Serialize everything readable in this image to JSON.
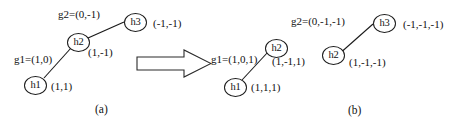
{
  "figure": {
    "type": "diagram",
    "arrow_icon": "right-arrow-icon",
    "line_color": "#1a1a1a",
    "background_color": "#ffffff"
  },
  "panel_a": {
    "caption": "(a)",
    "nodes": [
      {
        "id": "h1",
        "label": "h1",
        "value": "(1,1)"
      },
      {
        "id": "h2",
        "label": "h2",
        "value": "(1,-1)"
      },
      {
        "id": "h3",
        "label": "h3",
        "value": "(-1,-1)"
      }
    ],
    "edges": [
      {
        "id": "g1",
        "label": "g1=(1,0)",
        "from": "h1",
        "to": "h2"
      },
      {
        "id": "g2",
        "label": "g2=(0,-1)",
        "from": "h2",
        "to": "h3"
      }
    ]
  },
  "panel_b": {
    "caption": "(b)",
    "nodes": [
      {
        "id": "h1",
        "label": "h1",
        "value": "(1,1,1)"
      },
      {
        "id": "h2a",
        "label": "h2",
        "value": "(1,-1,1)"
      },
      {
        "id": "h2b",
        "label": "h2",
        "value": "(1,-1,-1)"
      },
      {
        "id": "h3",
        "label": "h3",
        "value": "(-1,-1,-1)"
      }
    ],
    "edges": [
      {
        "id": "g1",
        "label": "g1=(1,0,1)",
        "from": "h1",
        "to": "h2a"
      },
      {
        "id": "g2",
        "label": "g2=(0,-1,-1)",
        "from": "h2b",
        "to": "h3"
      }
    ]
  }
}
